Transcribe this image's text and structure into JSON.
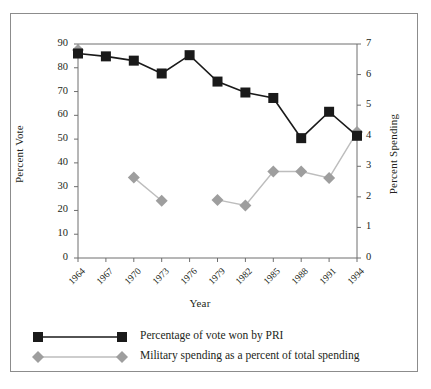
{
  "chart_data": {
    "type": "line",
    "title": "",
    "xlabel": "Year",
    "ylabel": "Percent Vote",
    "y2label": "Percent Spending",
    "categories": [
      "1964",
      "1967",
      "1970",
      "1973",
      "1976",
      "1979",
      "1982",
      "1985",
      "1988",
      "1991",
      "1994"
    ],
    "x": [
      1964,
      1967,
      1970,
      1973,
      1976,
      1979,
      1982,
      1985,
      1988,
      1991,
      1994
    ],
    "ylim": [
      0,
      90
    ],
    "y2lim": [
      0,
      7
    ],
    "yticks": [
      0,
      10,
      20,
      30,
      40,
      50,
      60,
      70,
      80,
      90
    ],
    "y2ticks": [
      0,
      1,
      2,
      3,
      4,
      5,
      6,
      7
    ],
    "grid": false,
    "legend_position": "bottom-left",
    "series": [
      {
        "name": "Percentage of vote won by PRI",
        "axis": "left",
        "marker": "square",
        "color": "#1a1a1a",
        "values": [
          86,
          84.8,
          83,
          77.6,
          85.3,
          74.2,
          69.6,
          67.3,
          50.4,
          61.5,
          51.4
        ]
      },
      {
        "name": "Military spending as a percent of total spending",
        "axis": "right",
        "marker": "diamond",
        "color": "#9e9e9e",
        "values": [
          6.8,
          null,
          2.63,
          1.87,
          null,
          1.9,
          1.72,
          2.83,
          2.83,
          2.62,
          4.12
        ]
      }
    ]
  },
  "axes": {
    "left_ticks": [
      "90",
      "80",
      "70",
      "60",
      "50",
      "40",
      "30",
      "20",
      "10",
      "0"
    ],
    "right_ticks": [
      "7",
      "6",
      "5",
      "4",
      "3",
      "2",
      "1",
      "0"
    ],
    "x_ticks": [
      "1964",
      "1967",
      "1970",
      "1973",
      "1976",
      "1979",
      "1982",
      "1985",
      "1988",
      "1991",
      "1994"
    ],
    "left_title": "Percent Vote",
    "right_title": "Percent Spending",
    "x_title": "Year"
  },
  "legend": {
    "items": [
      {
        "label": "Percentage of vote won by PRI",
        "marker": "square",
        "color": "#1a1a1a"
      },
      {
        "label": "Military spending as a percent of total spending",
        "marker": "diamond",
        "color": "#9e9e9e"
      }
    ]
  },
  "colors": {
    "vote_series": "#1a1a1a",
    "spending_series": "#9e9e9e",
    "axis": "#6e6e6e",
    "frame": "#8c8c8c",
    "background": "#ffffff",
    "text": "#231f20"
  }
}
